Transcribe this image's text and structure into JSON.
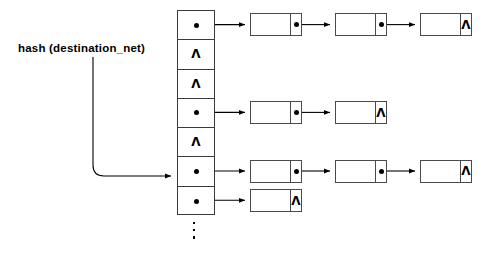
{
  "diagram": {
    "label": {
      "text": "hash (destination_net)",
      "name": "hash-function-label"
    },
    "colors": {
      "stroke": "#3a3a3a",
      "node_stroke": "#4a4a4a",
      "fill": "#ffffff",
      "dot": "#000000",
      "background": "#ffffff"
    },
    "null_symbol": "Λ",
    "ellipsis_dot_count": 3,
    "bucket_table": {
      "name": "hash-bucket-table",
      "slot_count": 7,
      "slots": [
        {
          "index": 0,
          "kind": "pointer",
          "chain_length": 3
        },
        {
          "index": 1,
          "kind": "null",
          "chain_length": 0
        },
        {
          "index": 2,
          "kind": "null",
          "chain_length": 0
        },
        {
          "index": 3,
          "kind": "pointer",
          "chain_length": 2
        },
        {
          "index": 4,
          "kind": "null",
          "chain_length": 0
        },
        {
          "index": 5,
          "kind": "pointer",
          "chain_length": 3
        },
        {
          "index": 6,
          "kind": "pointer",
          "chain_length": 1
        }
      ]
    },
    "chains": [
      {
        "name": "chain-row-1",
        "from_slot": 0,
        "nodes": [
          {
            "tail": "pointer"
          },
          {
            "tail": "pointer"
          },
          {
            "tail": "null"
          }
        ]
      },
      {
        "name": "chain-row-2",
        "from_slot": 3,
        "nodes": [
          {
            "tail": "pointer"
          },
          {
            "tail": "null"
          }
        ]
      },
      {
        "name": "chain-row-3",
        "from_slot": 5,
        "nodes": [
          {
            "tail": "pointer"
          },
          {
            "tail": "pointer"
          },
          {
            "tail": "null"
          }
        ]
      },
      {
        "name": "chain-row-4",
        "from_slot": 6,
        "nodes": [
          {
            "tail": "null"
          }
        ]
      }
    ],
    "hash_arrow": {
      "name": "hash-to-slot-arrow",
      "target_slot": 5
    }
  }
}
